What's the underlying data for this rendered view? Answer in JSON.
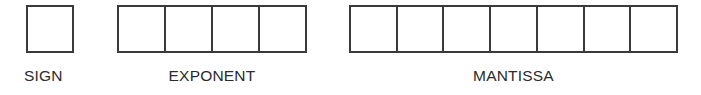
{
  "diagram": {
    "background_color": "#ffffff",
    "stroke_color": "#3a3a3a",
    "text_color": "#2b2b2b",
    "fields": [
      {
        "id": "sign",
        "label": "SIGN",
        "cell_count": 1,
        "cells": [
          ""
        ]
      },
      {
        "id": "exponent",
        "label": "EXPONENT",
        "cell_count": 4,
        "cells": [
          "",
          "",
          "",
          ""
        ]
      },
      {
        "id": "mantissa",
        "label": "MANTISSA",
        "cell_count": 7,
        "cells": [
          "",
          "",
          "",
          "",
          "",
          "",
          ""
        ]
      }
    ]
  }
}
